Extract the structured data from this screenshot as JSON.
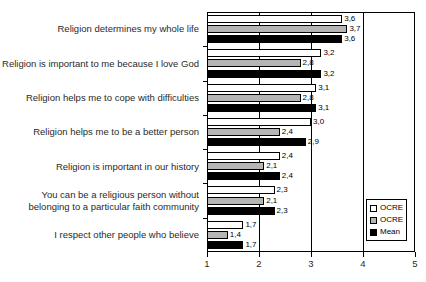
{
  "chart_data": {
    "type": "bar",
    "orientation": "horizontal",
    "title": "",
    "xlabel": "",
    "ylabel": "",
    "xlim": [
      1,
      5
    ],
    "xticks": [
      1,
      2,
      3,
      4,
      5
    ],
    "xtick_labels": [
      "1",
      "2",
      "3",
      "4",
      "5"
    ],
    "grid": true,
    "legend_position": "bottom-right",
    "decimal_separator": ",",
    "categories": [
      "Religion determines my whole life",
      "Religion is important to me because I love God",
      "Religion helps me to cope with difficulties",
      "Religion helps me to be a better person",
      "Religion is important in our history",
      "You can be a religious person without belonging to a particular faith community",
      "I respect other people who believe"
    ],
    "series": [
      {
        "name": "OCRE",
        "color": "#ffffff",
        "values": [
          3.6,
          3.2,
          3.1,
          3.0,
          2.4,
          2.3,
          1.7
        ],
        "labels": [
          "3,6",
          "3,2",
          "3,1",
          "3,0",
          "2,4",
          "2,3",
          "1,7"
        ]
      },
      {
        "name": "OCRE",
        "color": "#b5b5b5",
        "values": [
          3.7,
          2.8,
          2.8,
          2.4,
          2.1,
          2.1,
          1.4
        ],
        "labels": [
          "3,7",
          "2,8",
          "2,8",
          "2,4",
          "2,1",
          "2,1",
          "1,4"
        ]
      },
      {
        "name": "Mean",
        "color": "#000000",
        "values": [
          3.6,
          3.2,
          3.1,
          2.9,
          2.4,
          2.3,
          1.7
        ],
        "labels": [
          "3,6",
          "3,2",
          "3,1",
          "2,9",
          "2,4",
          "2,3",
          "1,7"
        ]
      }
    ]
  },
  "legend": {
    "items": [
      {
        "label": "OCRE",
        "swatch": "white-square-icon"
      },
      {
        "label": "OCRE",
        "swatch": "gray-square-icon"
      },
      {
        "label": "Mean",
        "swatch": "black-square-icon"
      }
    ]
  }
}
